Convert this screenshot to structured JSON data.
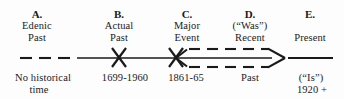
{
  "diagram": {
    "width": 344,
    "height": 99,
    "ink_color": "#1a1a1a",
    "background_color": "#fdfdfd"
  },
  "stages": [
    {
      "letter": "A.",
      "above_line_1": "Edenic",
      "above_line_2": "Past",
      "below_line_1": "No  historical",
      "below_line_2": "time",
      "x_center": 37,
      "line_style": "dashed"
    },
    {
      "letter": "B.",
      "above_line_1": "Actual",
      "above_line_2": "Past",
      "below_line_1": "1699-1960",
      "below_line_2": "",
      "x_center": 119,
      "line_style": "solid",
      "marker": "x-cross"
    },
    {
      "letter": "C.",
      "above_line_1": "Major",
      "above_line_2": "Event",
      "below_line_1": "1861-65",
      "below_line_2": "",
      "x_center": 187,
      "line_style": "solid",
      "marker": "x-cross"
    },
    {
      "letter": "D.",
      "above_line_1": "(“Was”)",
      "above_line_2": "Recent",
      "below_line_1": "Past",
      "below_line_2": "",
      "x_center": 250,
      "line_style": "dashed-arrow"
    },
    {
      "letter": "E.",
      "above_line_1": "",
      "above_line_2": "Present",
      "below_line_1": "(“Is”)",
      "below_line_2": "1920  +",
      "x_center": 310,
      "line_style": "solid"
    }
  ],
  "annotations": {
    "axis_label": "timeline-axis",
    "marker_b_label": "cross-marker-actual-past",
    "marker_c_label": "cross-marker-major-event",
    "arrow_label": "dashed-arrow-recent-past"
  }
}
